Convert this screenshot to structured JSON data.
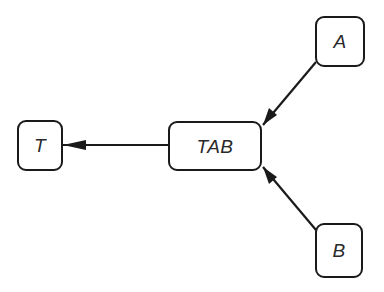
{
  "diagram": {
    "type": "directed-graph",
    "nodes": [
      {
        "id": "A",
        "label": "A"
      },
      {
        "id": "B",
        "label": "B"
      },
      {
        "id": "TAB",
        "label": "TAB"
      },
      {
        "id": "T",
        "label": "T"
      }
    ],
    "edges": [
      {
        "from": "A",
        "to": "TAB"
      },
      {
        "from": "B",
        "to": "TAB"
      },
      {
        "from": "TAB",
        "to": "T"
      }
    ],
    "colors": {
      "stroke": "#1a1a1a",
      "text": "#2a2a2a",
      "background": "#ffffff"
    }
  }
}
